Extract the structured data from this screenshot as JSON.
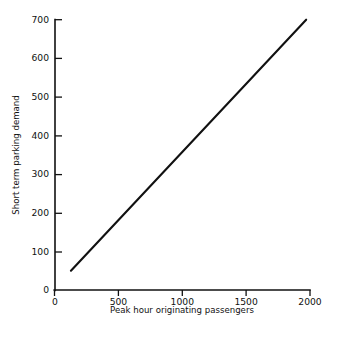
{
  "chart_data": {
    "type": "line",
    "title": "",
    "subtitle": "",
    "xlabel": "Peak hour originating passengers",
    "ylabel": "Short term parking demand",
    "xlim": [
      0,
      2000
    ],
    "ylim": [
      0,
      700
    ],
    "xticks": [
      0,
      500,
      1000,
      1500,
      2000
    ],
    "xtick_labels": [
      "0",
      "500",
      "1000",
      "1500",
      "2000"
    ],
    "yticks": [
      0,
      100,
      200,
      300,
      400,
      500,
      600,
      700
    ],
    "ytick_labels": [
      "0",
      "100",
      "200",
      "300",
      "400",
      "500",
      "600",
      "700"
    ],
    "grid": false,
    "legend": null,
    "legend_position": "none",
    "annotations": [],
    "line_color": "#111111",
    "background_color": "#ffffff",
    "series": [
      {
        "name": "Short term parking demand",
        "x": [
          125,
          2000
        ],
        "values": [
          50,
          710
        ],
        "points": [
          {
            "x": 125,
            "y": 50
          },
          {
            "x": 500,
            "y": 182
          },
          {
            "x": 1000,
            "y": 358
          },
          {
            "x": 1500,
            "y": 534
          },
          {
            "x": 1970,
            "y": 700
          }
        ]
      }
    ]
  },
  "axes": {
    "y_axis_name": "Short term parking demand",
    "x_axis_name": "Peak hour originating passengers"
  }
}
